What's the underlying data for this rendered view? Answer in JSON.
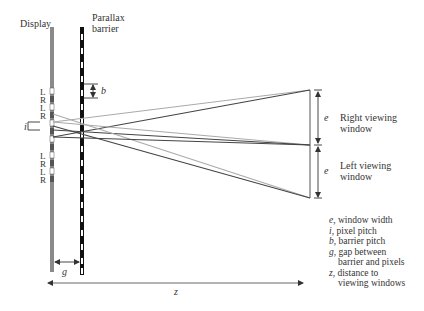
{
  "labels": {
    "display": "Display",
    "barrier_line1": "Parallax",
    "barrier_line2": "barrier",
    "b": "b",
    "i": "i",
    "g": "g",
    "z": "z",
    "e_top": "e",
    "e_bottom": "e",
    "right_window_line1": "Right viewing",
    "right_window_line2": "window",
    "left_window_line1": "Left viewing",
    "left_window_line2": "window",
    "pixel_labels_top": [
      "L",
      "R",
      "L",
      "R"
    ],
    "pixel_labels_bottom": [
      "L",
      "R",
      "L",
      "R"
    ]
  },
  "legend": [
    {
      "symbol": "e",
      "text": ", window width"
    },
    {
      "symbol": "i",
      "text": ", pixel pitch"
    },
    {
      "symbol": "b",
      "text": ", barrier pitch"
    },
    {
      "symbol": "g",
      "text": ", gap between"
    },
    {
      "symbol": "",
      "text": "barrier and pixels",
      "indent": true
    },
    {
      "symbol": "z",
      "text": ", distance to"
    },
    {
      "symbol": "",
      "text": "viewing windows",
      "indent": true
    }
  ],
  "colors": {
    "display": "#8a8a8a",
    "barrier_dark": "#111111",
    "ray_dark": "#444444",
    "ray_light": "#aaaaaa"
  }
}
